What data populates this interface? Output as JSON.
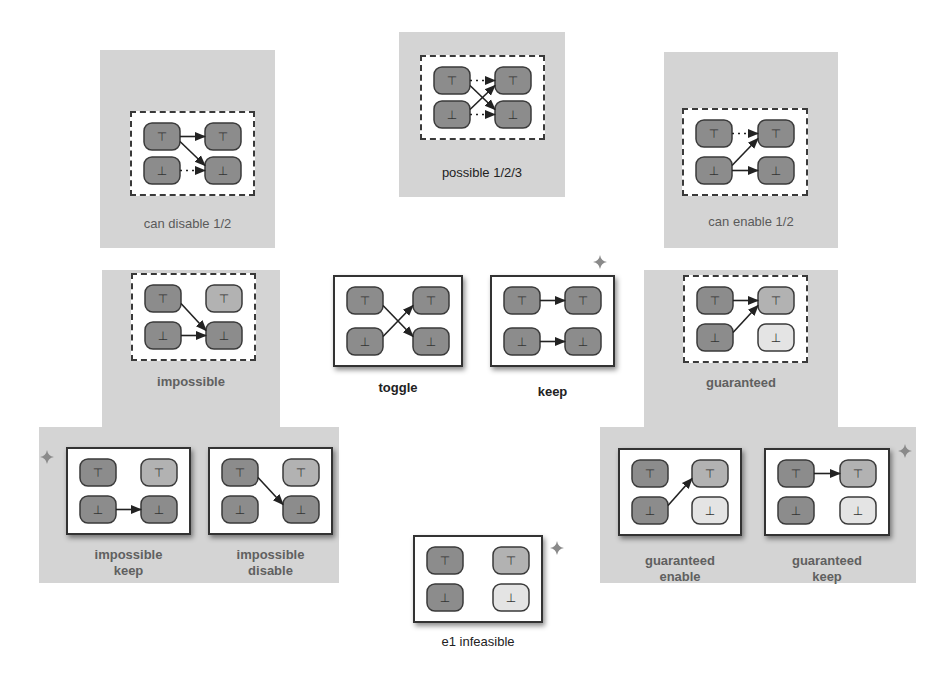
{
  "colors": {
    "region_bg": "#d4d4d4",
    "node_dark": "#8c8c8c",
    "node_medium": "#b2b2b2",
    "node_light": "#e4e4e4",
    "node_border": "#3a3a3a",
    "edge": "#222222",
    "star": "#8a8a8a"
  },
  "symbols": {
    "top": "⊤",
    "bottom": "⊥"
  },
  "regions": [
    {
      "id": "can-disable-region",
      "x": 100,
      "y": 50,
      "w": 175,
      "h": 198
    },
    {
      "id": "possible-region",
      "x": 399,
      "y": 32,
      "w": 166,
      "h": 165
    },
    {
      "id": "can-enable-region",
      "x": 664,
      "y": 52,
      "w": 174,
      "h": 196
    },
    {
      "id": "impossible-region-upper",
      "x": 102,
      "y": 270,
      "w": 178,
      "h": 160
    },
    {
      "id": "impossible-region-lower",
      "x": 39,
      "y": 427,
      "w": 157,
      "h": 156
    },
    {
      "id": "impossible-region-lower-b",
      "x": 196,
      "y": 427,
      "w": 143,
      "h": 156
    },
    {
      "id": "guaranteed-region-upper",
      "x": 644,
      "y": 270,
      "w": 194,
      "h": 160
    },
    {
      "id": "guaranteed-region-lower",
      "x": 600,
      "y": 427,
      "w": 316,
      "h": 156
    }
  ],
  "diagrams": [
    {
      "id": "can-disable",
      "label": "can disable 1/2",
      "style": "dashed",
      "label_bold": false,
      "x": 130,
      "y": 111,
      "w": 125,
      "h": 85,
      "label_x": 100,
      "label_y": 216,
      "label_w": 175,
      "nodes": {
        "tl": "dark",
        "tr": "dark",
        "bl": "dark",
        "br": "dark"
      },
      "edges": [
        {
          "from": "tl",
          "to": "tr",
          "dotted": false
        },
        {
          "from": "tl",
          "to": "br",
          "dotted": false
        },
        {
          "from": "bl",
          "to": "br",
          "dotted": true
        }
      ]
    },
    {
      "id": "possible",
      "label": "possible 1/2/3",
      "style": "dashed",
      "label_bold": false,
      "label_dark": true,
      "x": 420,
      "y": 55,
      "w": 125,
      "h": 85,
      "label_x": 399,
      "label_y": 165,
      "label_w": 166,
      "nodes": {
        "tl": "dark",
        "tr": "dark",
        "bl": "dark",
        "br": "dark"
      },
      "edges": [
        {
          "from": "tl",
          "to": "tr",
          "dotted": true
        },
        {
          "from": "tl",
          "to": "br",
          "dotted": false
        },
        {
          "from": "bl",
          "to": "tr",
          "dotted": false
        },
        {
          "from": "bl",
          "to": "br",
          "dotted": true
        }
      ]
    },
    {
      "id": "can-enable",
      "label": "can enable 1/2",
      "style": "dashed",
      "label_bold": false,
      "x": 682,
      "y": 108,
      "w": 126,
      "h": 88,
      "label_x": 664,
      "label_y": 214,
      "label_w": 174,
      "nodes": {
        "tl": "dark",
        "tr": "dark",
        "bl": "dark",
        "br": "dark"
      },
      "edges": [
        {
          "from": "tl",
          "to": "tr",
          "dotted": true
        },
        {
          "from": "bl",
          "to": "tr",
          "dotted": false
        },
        {
          "from": "bl",
          "to": "br",
          "dotted": false
        }
      ]
    },
    {
      "id": "impossible",
      "label": "impossible",
      "style": "dashed",
      "label_bold": true,
      "x": 131,
      "y": 273,
      "w": 125,
      "h": 88,
      "label_x": 102,
      "label_y": 374,
      "label_w": 178,
      "nodes": {
        "tl": "dark",
        "tr": "medium",
        "bl": "dark",
        "br": "dark"
      },
      "edges": [
        {
          "from": "tl",
          "to": "br",
          "dotted": false
        },
        {
          "from": "bl",
          "to": "br",
          "dotted": false
        }
      ]
    },
    {
      "id": "toggle",
      "label": "toggle",
      "style": "solid",
      "label_bold": true,
      "label_dark": true,
      "x": 333,
      "y": 275,
      "w": 130,
      "h": 92,
      "label_x": 333,
      "label_y": 380,
      "label_w": 130,
      "nodes": {
        "tl": "dark",
        "tr": "dark",
        "bl": "dark",
        "br": "dark"
      },
      "edges": [
        {
          "from": "tl",
          "to": "br",
          "dotted": false
        },
        {
          "from": "bl",
          "to": "tr",
          "dotted": false
        }
      ]
    },
    {
      "id": "keep",
      "label": "keep",
      "style": "solid",
      "label_bold": true,
      "label_dark": true,
      "x": 490,
      "y": 275,
      "w": 125,
      "h": 92,
      "label_x": 490,
      "label_y": 384,
      "label_w": 125,
      "nodes": {
        "tl": "dark",
        "tr": "dark",
        "bl": "dark",
        "br": "dark"
      },
      "edges": [
        {
          "from": "tl",
          "to": "tr",
          "dotted": false
        },
        {
          "from": "bl",
          "to": "br",
          "dotted": false
        }
      ]
    },
    {
      "id": "guaranteed",
      "label": "guaranteed",
      "style": "dashed",
      "label_bold": true,
      "x": 683,
      "y": 275,
      "w": 125,
      "h": 88,
      "label_x": 644,
      "label_y": 375,
      "label_w": 194,
      "nodes": {
        "tl": "dark",
        "tr": "medium",
        "bl": "dark",
        "br": "light"
      },
      "edges": [
        {
          "from": "tl",
          "to": "tr",
          "dotted": false
        },
        {
          "from": "bl",
          "to": "tr",
          "dotted": false
        }
      ]
    },
    {
      "id": "impossible-keep",
      "label": "impossible\nkeep",
      "style": "solid",
      "label_bold": true,
      "x": 66,
      "y": 447,
      "w": 125,
      "h": 88,
      "label_x": 66,
      "label_y": 547,
      "label_w": 125,
      "nodes": {
        "tl": "dark",
        "tr": "medium",
        "bl": "dark",
        "br": "dark"
      },
      "edges": [
        {
          "from": "bl",
          "to": "br",
          "dotted": false
        }
      ]
    },
    {
      "id": "impossible-disable",
      "label": "impossible\ndisable",
      "style": "solid",
      "label_bold": true,
      "x": 208,
      "y": 447,
      "w": 125,
      "h": 88,
      "label_x": 208,
      "label_y": 547,
      "label_w": 125,
      "nodes": {
        "tl": "dark",
        "tr": "medium",
        "bl": "dark",
        "br": "dark"
      },
      "edges": [
        {
          "from": "tl",
          "to": "br",
          "dotted": false
        }
      ]
    },
    {
      "id": "guaranteed-enable",
      "label": "guaranteed\nenable",
      "style": "solid",
      "label_bold": true,
      "x": 618,
      "y": 448,
      "w": 124,
      "h": 88,
      "label_x": 618,
      "label_y": 553,
      "label_w": 124,
      "nodes": {
        "tl": "dark",
        "tr": "medium",
        "bl": "dark",
        "br": "light"
      },
      "edges": [
        {
          "from": "bl",
          "to": "tr",
          "dotted": false
        }
      ]
    },
    {
      "id": "guaranteed-keep",
      "label": "guaranteed\nkeep",
      "style": "solid",
      "label_bold": true,
      "x": 764,
      "y": 448,
      "w": 126,
      "h": 88,
      "label_x": 764,
      "label_y": 553,
      "label_w": 126,
      "nodes": {
        "tl": "dark",
        "tr": "medium",
        "bl": "dark",
        "br": "light"
      },
      "edges": [
        {
          "from": "tl",
          "to": "tr",
          "dotted": false
        }
      ]
    },
    {
      "id": "e1-infeasible",
      "label": "e1 infeasible",
      "style": "solid",
      "label_bold": false,
      "label_dark": true,
      "x": 413,
      "y": 535,
      "w": 130,
      "h": 88,
      "label_x": 413,
      "label_y": 634,
      "label_w": 130,
      "nodes": {
        "tl": "dark",
        "tr": "medium",
        "bl": "dark",
        "br": "light"
      },
      "edges": []
    }
  ],
  "stars": [
    {
      "id": "star-guaranteed",
      "x": 593,
      "y": 255
    },
    {
      "id": "star-impossible-keep",
      "x": 40,
      "y": 450
    },
    {
      "id": "star-guaranteed-keep",
      "x": 898,
      "y": 444
    },
    {
      "id": "star-e1-infeasible",
      "x": 550,
      "y": 541
    }
  ]
}
